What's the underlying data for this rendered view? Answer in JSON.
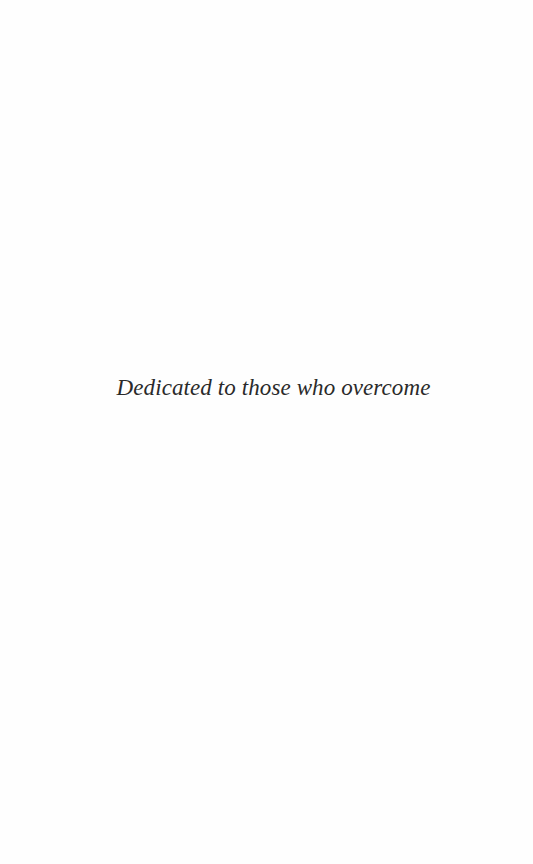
{
  "page": {
    "type": "dedication",
    "background_color": "#fefefe",
    "text_color": "#2a2a2a"
  },
  "dedication": {
    "text": "Dedicated to those who overcome"
  }
}
